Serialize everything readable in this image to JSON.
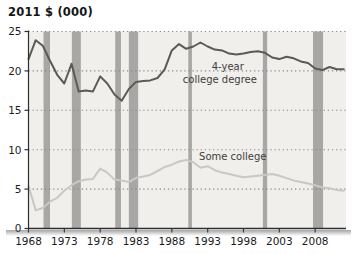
{
  "title": "2011 $ (000)",
  "chart_data": {
    "type": "line",
    "title": "2011 $ (000)",
    "xlabel": "",
    "ylabel": "2011 $ (000)",
    "xlim": [
      1968,
      2012.3
    ],
    "ylim": [
      0,
      25
    ],
    "xticks": [
      1968,
      1973,
      1978,
      1983,
      1988,
      1993,
      1998,
      2003,
      2008
    ],
    "yticks": [
      0,
      5,
      10,
      15,
      20,
      25
    ],
    "grid": "dotted horizontal gridlines at 5,10,15,20,25",
    "legend_position": "inline labels on chart",
    "x": [
      1968,
      1969,
      1970,
      1971,
      1972,
      1973,
      1974,
      1975,
      1976,
      1977,
      1978,
      1979,
      1980,
      1981,
      1982,
      1983,
      1984,
      1985,
      1986,
      1987,
      1988,
      1989,
      1990,
      1991,
      1992,
      1993,
      1994,
      1995,
      1996,
      1997,
      1998,
      1999,
      2000,
      2001,
      2002,
      2003,
      2004,
      2005,
      2006,
      2007,
      2008,
      2009,
      2010,
      2011,
      2012
    ],
    "series": [
      {
        "name": "4-year college degree",
        "color": "#5d5953",
        "values": [
          21.5,
          23.9,
          23.2,
          21.3,
          19.5,
          18.4,
          20.9,
          17.4,
          17.5,
          17.4,
          19.3,
          18.4,
          17.0,
          16.2,
          17.7,
          18.6,
          18.7,
          18.8,
          19.1,
          20.2,
          22.6,
          23.4,
          22.8,
          23.1,
          23.6,
          23.1,
          22.7,
          22.6,
          22.2,
          22.1,
          22.2,
          22.4,
          22.5,
          22.3,
          21.7,
          21.5,
          21.8,
          21.6,
          21.2,
          21.0,
          20.3,
          20.1,
          20.5,
          20.2,
          20.2
        ]
      },
      {
        "name": "Some college",
        "color": "#c9c8c4",
        "values": [
          5.4,
          2.3,
          2.6,
          3.4,
          3.9,
          4.8,
          5.5,
          6.0,
          6.2,
          6.3,
          7.6,
          7.1,
          6.2,
          6.1,
          5.9,
          6.4,
          6.6,
          6.8,
          7.3,
          7.8,
          8.1,
          8.5,
          8.7,
          8.4,
          7.7,
          7.9,
          7.4,
          7.1,
          6.9,
          6.7,
          6.5,
          6.6,
          6.7,
          6.8,
          6.9,
          6.7,
          6.4,
          6.1,
          5.9,
          5.7,
          5.5,
          5.2,
          5.1,
          4.9,
          4.8
        ]
      }
    ],
    "recession_bands": [
      [
        1970.1,
        1971.0
      ],
      [
        1974.05,
        1975.3
      ],
      [
        1980.1,
        1980.9
      ],
      [
        1982.0,
        1983.3
      ],
      [
        1990.3,
        1990.8
      ],
      [
        2000.7,
        2001.3
      ],
      [
        2007.7,
        2009.1
      ]
    ],
    "annotations": [
      {
        "text": "4-year",
        "x": 1995.8,
        "y": 20.6
      },
      {
        "text": "college degree",
        "x": 1994.7,
        "y": 18.9
      },
      {
        "text": "Some college",
        "x": 1996.5,
        "y": 9.1
      }
    ],
    "colors": {
      "plot_bg": "#f0efec",
      "band": "#a8a7a5",
      "grid": "#8c8c8c",
      "axis": "#2e2e2e",
      "tick_text": "#1b1b1b",
      "annotation_text": "#3f3d3a"
    }
  }
}
